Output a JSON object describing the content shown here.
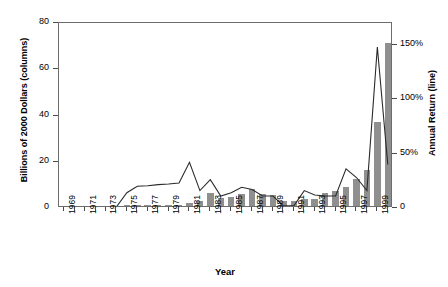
{
  "chart_data": {
    "type": "bar",
    "title": "",
    "subtitle": "",
    "xlabel": "Year",
    "ylabel": "Billions of 2000 Dollars (columns)",
    "y2label": "Annual Return (line)",
    "ylim": [
      0,
      80
    ],
    "yticks": [
      0,
      20,
      40,
      60,
      80
    ],
    "ytick_labels": [
      "0",
      "20",
      "40",
      "60",
      "80"
    ],
    "y2lim": [
      0,
      170
    ],
    "y2ticks": [
      0,
      50,
      100,
      150
    ],
    "y2tick_labels": [
      "0",
      "50%",
      "100%",
      "150%"
    ],
    "grid": false,
    "legend": "none",
    "bar_color": "#8f8f8f",
    "line_color": "#2b2b2b",
    "axis_color": "#6d6d6d",
    "categories": [
      "1969",
      "1970",
      "1971",
      "1972",
      "1973",
      "1974",
      "1975",
      "1976",
      "1977",
      "1978",
      "1979",
      "1980",
      "1981",
      "1982",
      "1983",
      "1984",
      "1985",
      "1986",
      "1987",
      "1988",
      "1989",
      "1990",
      "1991",
      "1992",
      "1993",
      "1994",
      "1995",
      "1996",
      "1997",
      "1998",
      "1999",
      "2000"
    ],
    "xtick_labels_shown": [
      "1969",
      "",
      "1971",
      "",
      "1973",
      "",
      "1975",
      "",
      "1977",
      "",
      "1979",
      "",
      "1981",
      "",
      "1983",
      "",
      "1985",
      "",
      "1987",
      "",
      "1989",
      "",
      "1991",
      "",
      "1993",
      "",
      "1995",
      "",
      "1997",
      "",
      "1999",
      ""
    ],
    "series": [
      {
        "name": "Billions of 2000 Dollars",
        "axis": "left",
        "type": "bar",
        "values": [
          0,
          0,
          0,
          0,
          0,
          0,
          0.2,
          0.2,
          0.2,
          0.3,
          0.4,
          0.6,
          1.2,
          2.0,
          5.5,
          3.6,
          4.0,
          5.2,
          7.5,
          5.0,
          4.8,
          2.3,
          2.3,
          2.9,
          3.2,
          5.5,
          6.5,
          8.2,
          11.5,
          15.5,
          36.5,
          70.5
        ]
      },
      {
        "name": "Annual Return",
        "axis": "right",
        "type": "line",
        "values": [
          0,
          0,
          0,
          0,
          0,
          1,
          14,
          20,
          20.5,
          21.5,
          22,
          23,
          42,
          16,
          26,
          11,
          14,
          19,
          17,
          11,
          11,
          2,
          2,
          16,
          12,
          11,
          11,
          36,
          28,
          16,
          148,
          40
        ]
      }
    ]
  }
}
